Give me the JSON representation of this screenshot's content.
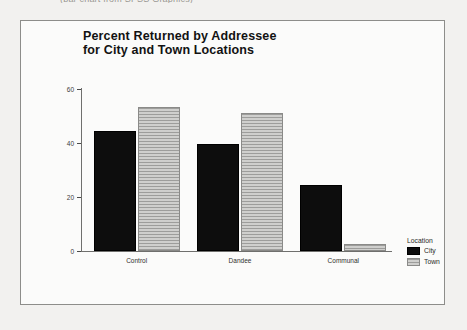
{
  "page": {
    "cut_caption": "(bar chart from SPSS Graphics)",
    "background_color": "#f2f1ef",
    "frame_color": "#8d8d8a"
  },
  "chart_data": {
    "type": "bar",
    "title": "Percent Returned by Addressee\nfor City and Town Locations",
    "xlabel": "",
    "ylabel": "",
    "categories": [
      "Control",
      "Dandee",
      "Communal"
    ],
    "series": [
      {
        "name": "City",
        "values": [
          44.5,
          39.5,
          24.5
        ],
        "color": "#0d0d0d"
      },
      {
        "name": "Town",
        "values": [
          53.5,
          51.0,
          2.5
        ],
        "color": "#b4b4b2"
      }
    ],
    "ylim": [
      0,
      60
    ],
    "yticks": [
      0,
      20,
      40,
      60
    ],
    "ytick_labels": [
      "0",
      "20",
      "40",
      "60"
    ],
    "grid": false,
    "legend": {
      "title": "Location",
      "position": "right",
      "entries": [
        "City",
        "Town"
      ]
    }
  }
}
